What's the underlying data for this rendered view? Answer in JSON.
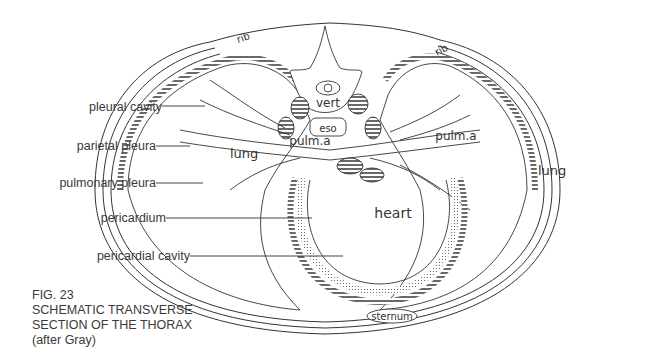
{
  "figure": {
    "number": "FIG. 23",
    "title_line1": "SCHEMATIC TRANSVERSE",
    "title_line2": "SECTION OF THE THORAX",
    "attribution": "(after Gray)"
  },
  "left_labels": [
    {
      "text": "pleural cavity"
    },
    {
      "text": "parietal pleura"
    },
    {
      "text": "pulmonary pleura"
    },
    {
      "text": "pericardium"
    },
    {
      "text": "pericardial cavity"
    }
  ],
  "inline_labels": {
    "rib_left": "rib",
    "rib_right": "rib",
    "vert": "vert",
    "eso": "eso",
    "pulm_a_left": "pulm.a",
    "pulm_a_right": "pulm.a",
    "lung_left": "lung",
    "lung_right": "lung",
    "heart": "heart",
    "sternum": "sternum"
  },
  "colors": {
    "ink": "#333333",
    "background": "#ffffff"
  }
}
